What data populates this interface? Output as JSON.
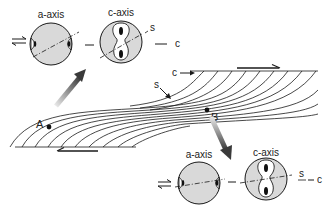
{
  "diagram": {
    "type": "shear-zone-fabric",
    "labels": {
      "top_a_axis": "a-axis",
      "top_c_axis": "c-axis",
      "top_s": "s",
      "top_c": "c",
      "zone_c": "c",
      "zone_s": "s",
      "point_a": "A",
      "point_b": "B",
      "bottom_a_axis": "a-axis",
      "bottom_c_axis": "c-axis",
      "bottom_s": "s",
      "bottom_c": "c"
    },
    "colors": {
      "line": "#1a1a1a",
      "circle_fill": "#d9d9d9",
      "lobe_fill": "#ffffff",
      "arrow_dark": "#3a3a3a",
      "arrow_light": "#dcdcdc"
    }
  }
}
